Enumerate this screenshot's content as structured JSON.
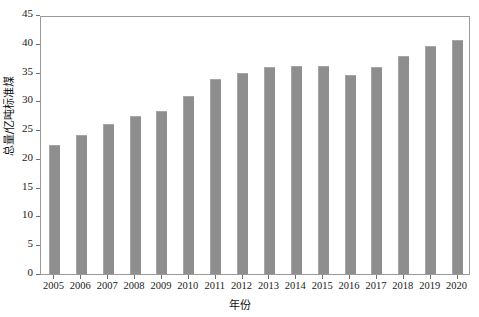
{
  "chart_data": {
    "type": "bar",
    "title": "",
    "xlabel": "年份",
    "ylabel": "总量/亿吨标准煤",
    "categories": [
      "2005",
      "2006",
      "2007",
      "2008",
      "2009",
      "2010",
      "2011",
      "2012",
      "2013",
      "2014",
      "2015",
      "2016",
      "2017",
      "2018",
      "2019",
      "2020"
    ],
    "values": [
      22.4,
      24.1,
      26.1,
      27.4,
      28.3,
      31.0,
      33.9,
      35.0,
      36.0,
      36.2,
      36.2,
      34.6,
      35.9,
      37.9,
      39.7,
      40.7
    ],
    "ylim": [
      0,
      45
    ],
    "yticks": [
      0,
      5,
      10,
      15,
      20,
      25,
      30,
      35,
      40,
      45
    ],
    "ytick_labels": [
      "0",
      "5",
      "10",
      "15",
      "20",
      "25",
      "30",
      "35",
      "40",
      "45"
    ],
    "xlim_categories": 16,
    "grid": false,
    "legend": null,
    "bar_color": "#8e8e8e",
    "axis_color": "#6f6f6f",
    "background_color": "#ffffff"
  }
}
